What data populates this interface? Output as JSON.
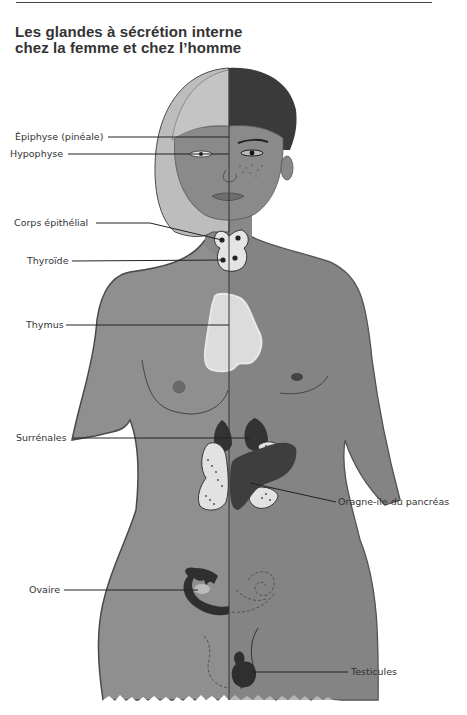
{
  "header": {
    "title_line1": "Les glandes à sécrétion interne",
    "title_line2": "chez la femme et chez l’homme"
  },
  "labels": {
    "epiphyse": "Épiphyse (pinéale)",
    "hypophyse": "Hypophyse",
    "corps_epithelial": "Corps épithélial",
    "thyroide": "Thyroïde",
    "thymus": "Thymus",
    "surrenales": "Surrénales",
    "pancreas": "Oragne-ile du pancréas",
    "ovaire": "Ovaire",
    "testicules": "Testicules"
  },
  "colors": {
    "skin": "#8c8c8c",
    "skin_dark": "#7a7a7a",
    "hair_female": "#bdbdbd",
    "hair_male": "#3a3a3a",
    "gland_light": "#e6e6e6",
    "gland_dark": "#3c3c3c",
    "outline": "#4a4a4a",
    "leader_line": "#222222"
  }
}
